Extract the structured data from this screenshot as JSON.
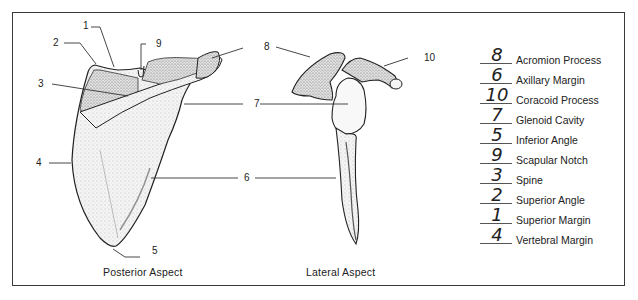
{
  "diagram": {
    "title_left": "Posterior Aspect",
    "title_right": "Lateral Aspect",
    "callouts": [
      {
        "id": "1",
        "label": "1"
      },
      {
        "id": "2",
        "label": "2"
      },
      {
        "id": "3",
        "label": "3"
      },
      {
        "id": "4",
        "label": "4"
      },
      {
        "id": "5",
        "label": "5"
      },
      {
        "id": "6",
        "label": "6"
      },
      {
        "id": "7",
        "label": "7"
      },
      {
        "id": "8",
        "label": "8"
      },
      {
        "id": "9",
        "label": "9"
      },
      {
        "id": "10",
        "label": "10"
      }
    ]
  },
  "answer_key": [
    {
      "answer": "8",
      "term": "Acromion Process"
    },
    {
      "answer": "6",
      "term": "Axillary Margin"
    },
    {
      "answer": "10",
      "term": "Coracoid Process"
    },
    {
      "answer": "7",
      "term": "Glenoid Cavity"
    },
    {
      "answer": "5",
      "term": "Inferior Angle"
    },
    {
      "answer": "9",
      "term": "Scapular Notch"
    },
    {
      "answer": "3",
      "term": "Spine"
    },
    {
      "answer": "2",
      "term": "Superior Angle"
    },
    {
      "answer": "1",
      "term": "Superior Margin"
    },
    {
      "answer": "4",
      "term": "Vertebral Margin"
    }
  ]
}
